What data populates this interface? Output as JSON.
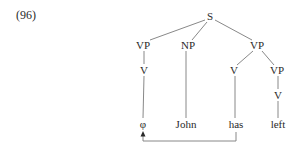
{
  "example_number": "(96)",
  "tree": {
    "nodes": [
      {
        "id": "S",
        "label": "S",
        "x": 210,
        "y": 20
      },
      {
        "id": "VP1",
        "label": "VP",
        "x": 143,
        "y": 48
      },
      {
        "id": "NP",
        "label": "NP",
        "x": 188,
        "y": 48
      },
      {
        "id": "VP2",
        "label": "VP",
        "x": 257,
        "y": 48
      },
      {
        "id": "V1",
        "label": "V",
        "x": 144,
        "y": 73
      },
      {
        "id": "V2",
        "label": "V",
        "x": 233,
        "y": 73
      },
      {
        "id": "VP3",
        "label": "VP",
        "x": 277,
        "y": 73
      },
      {
        "id": "V3",
        "label": "V",
        "x": 278,
        "y": 98
      },
      {
        "id": "phi",
        "label": "φ",
        "x": 143,
        "y": 128
      },
      {
        "id": "John",
        "label": "John",
        "x": 186,
        "y": 128
      },
      {
        "id": "has",
        "label": "has",
        "x": 236,
        "y": 128
      },
      {
        "id": "left",
        "label": "left",
        "x": 278,
        "y": 128
      }
    ],
    "labels": {
      "S": "S",
      "VP1": "VP",
      "NP": "NP",
      "VP2": "VP",
      "V1": "V",
      "V2": "V",
      "VP3": "VP",
      "V3": "V",
      "phi": "φ",
      "John": "John",
      "has": "has",
      "left": "left"
    },
    "edges": [
      [
        "S",
        "VP1"
      ],
      [
        "S",
        "NP"
      ],
      [
        "S",
        "VP2"
      ],
      [
        "VP1",
        "V1"
      ],
      [
        "V1",
        "phi"
      ],
      [
        "NP",
        "John"
      ],
      [
        "VP2",
        "V2"
      ],
      [
        "VP2",
        "VP3"
      ],
      [
        "V2",
        "has"
      ],
      [
        "VP3",
        "V3"
      ],
      [
        "V3",
        "left"
      ]
    ],
    "movement_arrow": {
      "from": "has",
      "to": "phi"
    }
  }
}
